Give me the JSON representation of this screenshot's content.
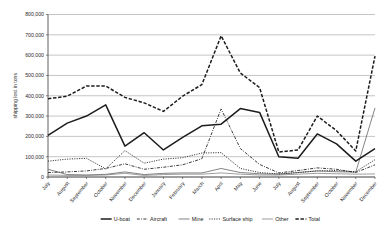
{
  "chart_data": {
    "type": "line",
    "title": "",
    "xlabel": "",
    "ylabel": "shipping lost in tons",
    "ylim": [
      0,
      800000
    ],
    "ytick_step": 100000,
    "grid": true,
    "legend_position": "bottom",
    "categories": [
      "July",
      "August",
      "September",
      "October",
      "November",
      "December",
      "January",
      "February",
      "March",
      "April",
      "May",
      "June",
      "July",
      "August",
      "September",
      "October",
      "November",
      "December"
    ],
    "ytick_labels": [
      "0",
      "100,000",
      "200,000",
      "300,000",
      "400,000",
      "500,000",
      "600,000",
      "700,000",
      "800,000"
    ],
    "ytick_values": [
      0,
      100000,
      200000,
      300000,
      400000,
      500000,
      600000,
      700000,
      800000
    ],
    "series": [
      {
        "name": "U-boat",
        "style": "solid-thick",
        "color": "#1c1c1c",
        "values": [
          205000,
          265000,
          300000,
          355000,
          152000,
          218000,
          133000,
          195000,
          252000,
          260000,
          337000,
          318000,
          100000,
          92000,
          212000,
          163000,
          78000,
          140000
        ]
      },
      {
        "name": "Aircraft",
        "style": "dash-dot",
        "color": "#262626",
        "values": [
          22000,
          25000,
          30000,
          42000,
          65000,
          38000,
          48000,
          60000,
          90000,
          335000,
          140000,
          62000,
          20000,
          32000,
          45000,
          38000,
          22000,
          60000
        ]
      },
      {
        "name": "Mine",
        "style": "solid-thin",
        "color": "#6e6e6e",
        "values": [
          38000,
          12000,
          10000,
          13000,
          25000,
          12000,
          18000,
          20000,
          20000,
          42000,
          22000,
          16000,
          14000,
          22000,
          30000,
          26000,
          24000,
          340000
        ]
      },
      {
        "name": "Surface ship",
        "style": "dotted",
        "color": "#333333",
        "values": [
          78000,
          88000,
          92000,
          40000,
          130000,
          68000,
          88000,
          95000,
          118000,
          120000,
          42000,
          22000,
          15000,
          22000,
          30000,
          32000,
          26000,
          85000
        ]
      },
      {
        "name": "Other",
        "style": "solid-thin-gray",
        "color": "#8c8c8c",
        "values": [
          10000,
          8000,
          8000,
          10000,
          18000,
          8000,
          12000,
          14000,
          14000,
          20000,
          14000,
          10000,
          10000,
          14000,
          18000,
          16000,
          14000,
          15000
        ]
      },
      {
        "name": "Total",
        "style": "dashed-thick",
        "color": "#1c1c1c",
        "values": [
          385000,
          398000,
          448000,
          448000,
          392000,
          365000,
          323000,
          398000,
          455000,
          695000,
          512000,
          440000,
          123000,
          133000,
          300000,
          228000,
          128000,
          595000
        ]
      }
    ]
  },
  "legend": {
    "items": [
      {
        "label": "U-boat",
        "style": "solid-thick"
      },
      {
        "label": "Aircraft",
        "style": "dash-dot"
      },
      {
        "label": "Mine",
        "style": "solid-thin"
      },
      {
        "label": "Surface ship",
        "style": "dotted"
      },
      {
        "label": "Other",
        "style": "solid-thin-gray"
      },
      {
        "label": "Total",
        "style": "dashed-thick"
      }
    ]
  }
}
